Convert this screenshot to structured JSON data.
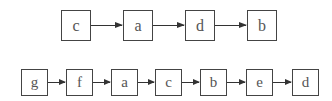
{
  "diagram": {
    "rows": [
      {
        "name": "sequence-1",
        "nodes": [
          "c",
          "a",
          "d",
          "b"
        ]
      },
      {
        "name": "sequence-2",
        "nodes": [
          "g",
          "f",
          "a",
          "c",
          "b",
          "e",
          "d"
        ]
      }
    ],
    "colors": {
      "stroke": "#444444",
      "text": "#555555",
      "background": "#ffffff"
    }
  }
}
